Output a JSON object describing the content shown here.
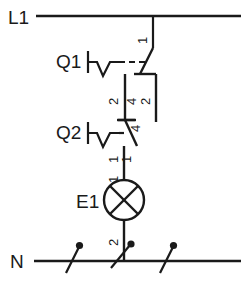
{
  "diagram": {
    "type": "electrical-ladder-schematic",
    "standard": "IEC",
    "line_color": "#1a1a1a",
    "background_color": "#ffffff"
  },
  "rails": {
    "top": {
      "label": "L1",
      "name": "line-rail"
    },
    "bottom": {
      "label": "N",
      "name": "neutral-rail"
    }
  },
  "devices": [
    {
      "id": "Q1",
      "label": "Q1",
      "kind": "switch-contact",
      "contact": "normally-closed",
      "actuator": "manual",
      "terminals": {
        "in": "1",
        "out": "2"
      }
    },
    {
      "id": "Q2",
      "label": "Q2",
      "kind": "switch-contact",
      "contact": "normally-closed",
      "actuator": "manual",
      "terminals": {
        "in": "4",
        "out": "1"
      }
    },
    {
      "id": "E1",
      "label": "E1",
      "kind": "indicator-lamp",
      "symbol": "circle-with-cross",
      "terminals": {
        "in": "1",
        "out": "2"
      }
    }
  ],
  "terminal_marks": {
    "q1_top": "1",
    "q1_bottom": "2",
    "link_left_upper": "4",
    "link_left_lower": "2",
    "link_right_upper": "2",
    "link_right_lower": "4",
    "q2_left": "1",
    "q2_right": "1",
    "lamp_top": "1",
    "lamp_bottom": "2"
  },
  "neutral_markers": [
    {
      "name": "pin-marker-left"
    },
    {
      "name": "pin-marker-center"
    },
    {
      "name": "pin-marker-right"
    }
  ]
}
